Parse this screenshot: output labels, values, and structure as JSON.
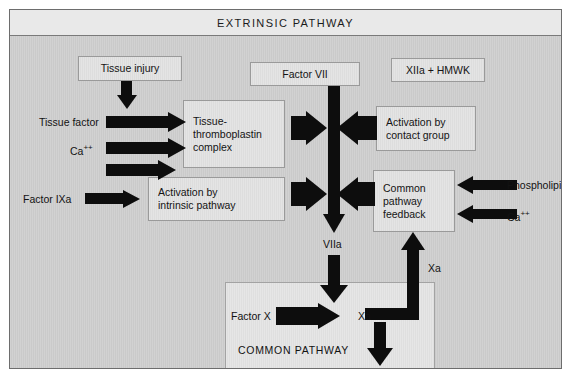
{
  "figure": {
    "title": "EXTRINSIC PATHWAY",
    "colors": {
      "canvas_bg": "#cfcfcf",
      "box_fill": "#e1e1e1",
      "box_border": "#9a9a9a",
      "arrow": "#0d0d0d",
      "frame": "#6d6d6d",
      "title_bar": "#e9e9e9",
      "text": "#141414"
    }
  },
  "nodes": {
    "tissue_injury": "Tissue injury",
    "factor_vii": "Factor VII",
    "xiia_hmwk": "XIIa  +  HMWK",
    "tissue_thromboplastin": "Tissue-\nthromboplastin\ncomplex",
    "tissue_thromboplastin_line1": "Tissue-",
    "tissue_thromboplastin_line2": "thromboplastin",
    "tissue_thromboplastin_line3": "complex",
    "activation_intrinsic_line1": "Activation by",
    "activation_intrinsic_line2": "intrinsic pathway",
    "activation_contact_line1": "Activation by",
    "activation_contact_line2": "contact group",
    "common_feedback_line1": "Common",
    "common_feedback_line2": "pathway",
    "common_feedback_line3": "feedback",
    "common_pathway": "COMMON PATHWAY"
  },
  "labels": {
    "tissue_factor": "Tissue factor",
    "ca_left": "Ca",
    "ca_left_sup": "++",
    "factor_ixa": "Factor IXa",
    "phospholipid": "Phospholipid",
    "ca_right": "Ca",
    "ca_right_sup": "++",
    "viia": "VIIa",
    "factor_x": "Factor X",
    "xa_box": "Xa",
    "xa_feedback": "Xa"
  },
  "edges": [
    {
      "name": "tissue-injury-to-complex",
      "from": "Tissue injury",
      "to": "Tissue-thromboplastin complex",
      "direction": "down"
    },
    {
      "name": "tissue-factor-to-complex",
      "from": "Tissue factor",
      "to": "Tissue-thromboplastin complex",
      "direction": "right"
    },
    {
      "name": "calcium-to-complex",
      "from": "Ca++",
      "to": "Tissue-thromboplastin complex",
      "direction": "right"
    },
    {
      "name": "unlabeled-to-complex",
      "from": "",
      "to": "Tissue-thromboplastin complex",
      "direction": "right"
    },
    {
      "name": "factor-ixa-to-intrinsic",
      "from": "Factor IXa",
      "to": "Activation by intrinsic pathway",
      "direction": "right"
    },
    {
      "name": "complex-to-factor-vii",
      "from": "Tissue-thromboplastin complex",
      "to": "Factor VII",
      "direction": "right"
    },
    {
      "name": "intrinsic-to-factor-vii",
      "from": "Activation by intrinsic pathway",
      "to": "Factor VII",
      "direction": "right"
    },
    {
      "name": "contact-group-to-factor-vii",
      "from": "Activation by contact group",
      "to": "Factor VII",
      "direction": "left"
    },
    {
      "name": "feedback-to-factor-vii",
      "from": "Common pathway feedback",
      "to": "Factor VII",
      "direction": "left"
    },
    {
      "name": "phospholipid-to-feedback",
      "from": "Phospholipid",
      "to": "Common pathway feedback",
      "direction": "left"
    },
    {
      "name": "calcium-to-feedback",
      "from": "Ca++",
      "to": "Common pathway feedback",
      "direction": "left"
    },
    {
      "name": "factor-vii-to-viia",
      "from": "Factor VII",
      "to": "VIIa",
      "direction": "down"
    },
    {
      "name": "viia-to-common-pathway",
      "from": "VIIa",
      "to": "COMMON PATHWAY",
      "direction": "down"
    },
    {
      "name": "factor-x-to-xa",
      "from": "Factor X",
      "to": "Xa",
      "direction": "right"
    },
    {
      "name": "xa-downstream",
      "from": "Xa",
      "to": "",
      "direction": "down"
    },
    {
      "name": "xa-to-feedback",
      "from": "Xa",
      "to": "Common pathway feedback",
      "direction": "up"
    }
  ]
}
